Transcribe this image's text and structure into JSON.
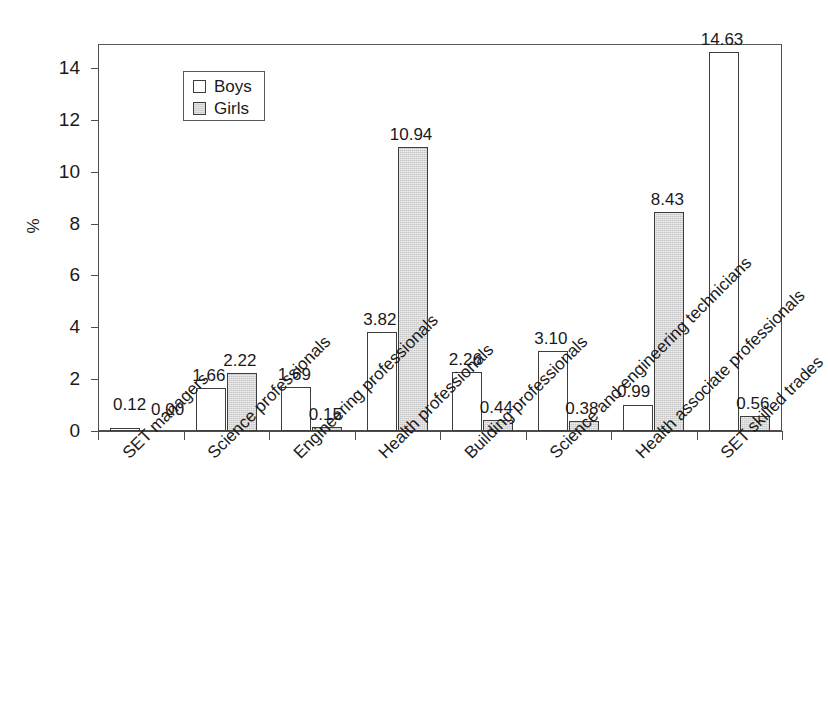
{
  "chart_data": {
    "type": "bar",
    "title": "",
    "subtitle": "",
    "xlabel": "",
    "ylabel": "%",
    "ylim": [
      0,
      15.5
    ],
    "yticks": [
      0,
      2,
      4,
      6,
      8,
      10,
      12,
      14
    ],
    "grid": true,
    "legend_position": "top-left-inside",
    "categories": [
      "SET managers",
      "Science professionals",
      "Engineering professionals",
      "Health professionals",
      "Building professionals",
      "Science and engineering technicians",
      "Health associate professionals",
      "SET skilled trades"
    ],
    "series": [
      {
        "name": "Boys",
        "color": "#ffffff",
        "values": [
          0.12,
          1.66,
          1.69,
          3.82,
          2.26,
          3.1,
          0.99,
          14.63
        ],
        "labels": [
          "0.12",
          "1.66",
          "1.69",
          "3.82",
          "2.26",
          "3.10",
          "0.99",
          "14.63"
        ]
      },
      {
        "name": "Girls",
        "color": "#d2d2d2",
        "values": [
          0.0,
          2.22,
          0.15,
          10.94,
          0.44,
          0.38,
          8.43,
          0.56
        ],
        "labels": [
          "0.00",
          "2.22",
          "0.15",
          "10.94",
          "0.44",
          "0.38",
          "8.43",
          "0.56"
        ]
      }
    ]
  },
  "legend": {
    "items": [
      {
        "label": "Boys",
        "swatch": "white-square-icon"
      },
      {
        "label": "Girls",
        "swatch": "gray-square-icon"
      }
    ]
  },
  "axes": {
    "y_title": "%",
    "y_tick_labels": [
      "0",
      "2",
      "4",
      "6",
      "8",
      "10",
      "12",
      "14"
    ]
  }
}
